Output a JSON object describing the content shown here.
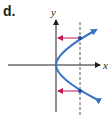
{
  "figure": {
    "panel_label": "d.",
    "x_axis_label": "x",
    "y_axis_label": "y",
    "colors": {
      "axis": "#231f20",
      "curve": "#3a73c6",
      "arrow": "#c2185b",
      "dashed_line": "#555555",
      "point": "#1f4e99"
    }
  }
}
